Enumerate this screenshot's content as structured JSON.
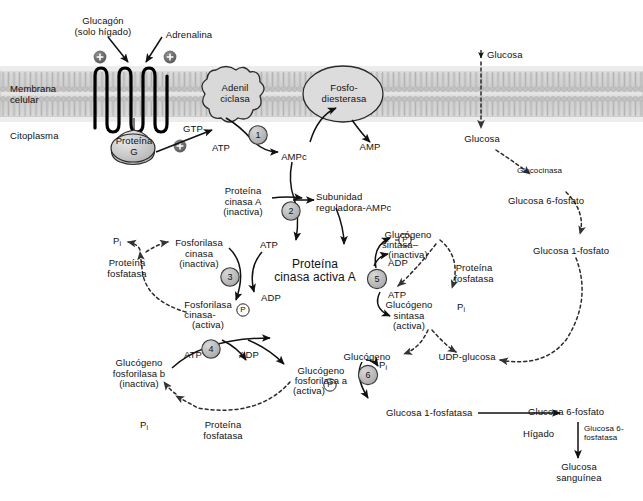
{
  "diagram": {
    "colors": {
      "membrane": "#c9c9c9",
      "shape_fill": "#d4d4d4",
      "circle_fill": "#bdbdbd",
      "stroke": "#1a1a1a",
      "dashed": "#2b2b2b"
    }
  },
  "hormones": {
    "glucagon": "Glucagón\n(solo hígado)",
    "adrenalina": "Adrenalina",
    "plus_left": "+",
    "plus_right": "+",
    "plus_gprotein": "+"
  },
  "membrane": {
    "label": "Membrana\ncelular",
    "cytoplasm_label": "Citoplasma"
  },
  "enzymes": {
    "adenil_ciclasa": "Adenil\nciclasa",
    "fosfodiesterasa": "Fosfo-\ndiesterasa",
    "proteina_g": "Proteína\nG"
  },
  "steps": {
    "s1": "1",
    "s2": "2",
    "s3": "3",
    "s4": "4",
    "s5": "5",
    "s6": "6"
  },
  "nodes": {
    "gtp": "GTP",
    "atp_1": "ATP",
    "ampc": "AMPc",
    "amp": "AMP",
    "proteina_cinasa_a_inactiva": "Proteína\ncinasa A\n(inactiva)",
    "subunidad_reguladora": "Subunidad\nreguladora-AMPc",
    "proteina_cinasa_activa_a": "Proteína\ncinasa activa A",
    "atp_3": "ATP",
    "adp_3": "ADP",
    "fosforilasa_cinasa_inactiva": "Fosforilasa\ncinasa\n(inactiva)",
    "fosforilasa_cinasa_activa_l1": "Fosforilasa",
    "fosforilasa_cinasa_activa_l2": "cinasa-",
    "fosforilasa_cinasa_activa_l3": "(activa)",
    "pi_left_top": "P",
    "pi_left_top_sub": "i",
    "proteina_fosfatasa_left": "Proteína\nfosfatasa",
    "atp_4": "ATP",
    "adp_4": "ADP",
    "glucogeno_fosforilasa_b": "Glucógeno\nfosforilasa b\n(inactiva)",
    "glucogeno_fosforilasa_a_l1": "Glucógeno",
    "glucogeno_fosforilasa_a_l2": "fosforilasa a",
    "glucogeno_fosforilasa_a_l3": "(activa)",
    "pi_bottom": "P",
    "pi_bottom_sub": "i",
    "proteina_fosfatasa_bottom": "Proteína\nfosfatasa",
    "glucogeno_sintasa_inactiva_l1": "Glucógeno",
    "glucogeno_sintasa_inactiva_l2": "sintasa–",
    "glucogeno_sintasa_inactiva_l3": "(inactiva)",
    "adp_5": "ADP",
    "atp_5": "ATP",
    "glucogeno_sintasa_activa": "Glucógeno\nsintasa\n(activa)",
    "proteina_fosfatasa_right": "Proteína\nfosfatasa",
    "pi_right": "P",
    "pi_right_sub": "i",
    "glucogeno": "Glucógeno",
    "pi_step6": "P",
    "pi_step6_sub": "i",
    "udp_glucosa": "UDP-glucosa",
    "glucosa_1_fosfatasa": "Glucosa 1-fosfatasa",
    "glucosa_extracelular": "Glucosa",
    "glucosa_intracelular": "Glucosa",
    "glucocinasa": "Glucocinasa",
    "glucosa_6_fosfato_top": "Glucosa 6-fosfato",
    "glucosa_1_fosfato": "Glucosa 1-fosfato",
    "glucosa_6_fosfato_bottom": "Glucosa 6-fosfato",
    "higado": "Hígado",
    "glucosa_6_fosfatasa": "Glucosa 6-\nfosfatasa",
    "glucosa_sanguinea": "Glucosa\nsanguínea",
    "phospho_badge": "P"
  }
}
